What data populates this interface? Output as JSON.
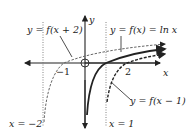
{
  "figure": {
    "labels": {
      "f_x_plus_2": "y = f(x + 2)",
      "f_x_ln": "y = f(x) = ln x",
      "f_x_minus_1": "y = f(x − 1)",
      "asym_left": "x = −2",
      "asym_right": "x = 1",
      "axis_x": "x",
      "axis_y": "y",
      "tick_neg1": "−1",
      "tick_2": "2"
    },
    "colors": {
      "ink": "#222222",
      "asymptote": "#777777"
    }
  }
}
